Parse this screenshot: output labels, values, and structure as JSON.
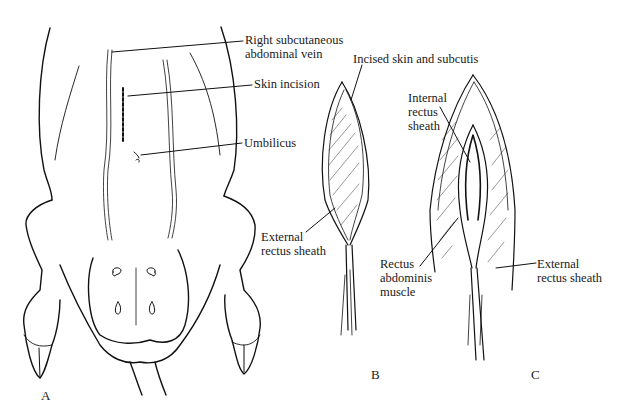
{
  "figure": {
    "panels": [
      {
        "id": "A",
        "label": "A"
      },
      {
        "id": "B",
        "label": "B"
      },
      {
        "id": "C",
        "label": "C"
      }
    ],
    "labels": {
      "a_vein": "Right subcutaneous\nabdominal vein",
      "a_incision": "Skin incision",
      "a_umbilicus": "Umbilicus",
      "b_incised": "Incised skin and subcutis",
      "b_external": "External\nrectus sheath",
      "c_internal": "Internal\nrectus\nsheath",
      "c_rectus": "Rectus\nabdominis\nmuscle",
      "c_external": "External\nrectus sheath"
    }
  }
}
